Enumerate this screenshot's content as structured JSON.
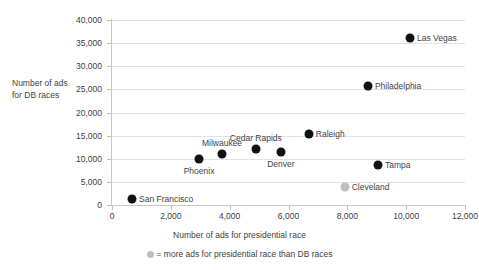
{
  "chart_data": {
    "type": "scatter",
    "title": "",
    "xlabel": "Number of ads for presidential race",
    "ylabel": "Number of ads for DB races",
    "ylabel_lines": [
      "Number of ads",
      "for DB races"
    ],
    "xlim": [
      0,
      12000
    ],
    "ylim": [
      0,
      40000
    ],
    "grid": true,
    "xticks": [
      0,
      2000,
      4000,
      6000,
      8000,
      10000,
      12000
    ],
    "xtick_labels": [
      "0",
      "2,000",
      "4,000",
      "6,000",
      "8,000",
      "10,000",
      "12,000"
    ],
    "yticks": [
      0,
      5000,
      10000,
      15000,
      20000,
      25000,
      30000,
      35000,
      40000
    ],
    "ytick_labels": [
      "0",
      "5,000",
      "10,000",
      "15,000",
      "20,000",
      "25,000",
      "30,000",
      "35,000",
      "40,000"
    ],
    "legend_position": "bottom-center",
    "legend": [
      {
        "marker": "light-gray-dot",
        "label": "= more ads for presidential race than DB races"
      }
    ],
    "points": [
      {
        "name": "San Francisco",
        "x": 680,
        "y": 1300,
        "color": "#111111",
        "style": "dark",
        "label_pos": "right"
      },
      {
        "name": "Phoenix",
        "x": 2960,
        "y": 9900,
        "color": "#111111",
        "style": "dark",
        "label_pos": "below"
      },
      {
        "name": "Milwaukee",
        "x": 3740,
        "y": 11000,
        "color": "#111111",
        "style": "dark",
        "label_pos": "above"
      },
      {
        "name": "Cedar Rapids",
        "x": 4890,
        "y": 12100,
        "color": "#111111",
        "style": "dark",
        "label_pos": "above"
      },
      {
        "name": "Denver",
        "x": 5740,
        "y": 11450,
        "color": "#111111",
        "style": "dark",
        "label_pos": "below"
      },
      {
        "name": "Raleigh",
        "x": 6690,
        "y": 15350,
        "color": "#111111",
        "style": "dark",
        "label_pos": "right"
      },
      {
        "name": "Cleveland",
        "x": 7910,
        "y": 3900,
        "color": "#bfbfbf",
        "style": "light",
        "label_pos": "right"
      },
      {
        "name": "Philadelphia",
        "x": 8700,
        "y": 25750,
        "color": "#111111",
        "style": "dark",
        "label_pos": "right"
      },
      {
        "name": "Tampa",
        "x": 9040,
        "y": 8650,
        "color": "#111111",
        "style": "dark",
        "label_pos": "right"
      },
      {
        "name": "Las Vegas",
        "x": 10130,
        "y": 36100,
        "color": "#111111",
        "style": "dark",
        "label_pos": "right"
      }
    ]
  },
  "colors": {
    "dark_marker": "#111111",
    "light_marker": "#bfbfbf",
    "gridline": "#e2e2e2",
    "axis": "#c8c8c8",
    "text": "#3f3f3f",
    "background": "#ffffff"
  }
}
